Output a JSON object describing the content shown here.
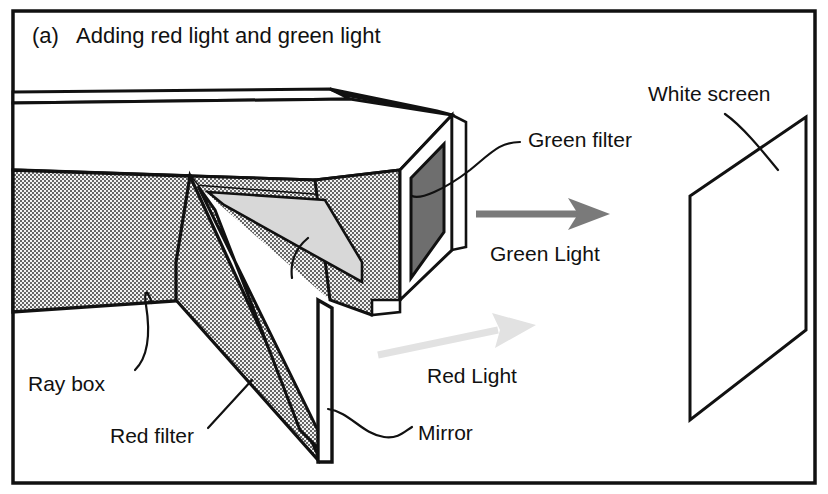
{
  "figure": {
    "panel_label": "(a)",
    "title": "Adding red light and green light",
    "background_color": "#ffffff",
    "ink_color": "#111111"
  },
  "labels": {
    "green_filter": "Green filter",
    "white_screen": "White screen",
    "green_light": "Green Light",
    "red_light": "Red Light",
    "ray_box": "Ray box",
    "red_filter": "Red filter",
    "mirror": "Mirror"
  },
  "colors": {
    "stipple_gray": "#c9c9c9",
    "red_filter_fill": "#d8d8d8",
    "green_filter_fill": "#6e6e6e",
    "green_arrow": "#7a7a7a",
    "red_arrow": "#e0e0e0",
    "box_lid_white": "#ffffff",
    "outline": "#111111"
  },
  "elements": {
    "ray_box": "stippled rectangular box seen in perspective, open at left",
    "mirror": "angled flat plate inside the ray box",
    "red_filter": "light gray triangular panel on the mirror face",
    "green_filter": "dark gray square panel on the far end of the ray box",
    "white_screen": "outlined parallelogram at right",
    "green_light_arrow": "horizontal gray arrow pointing right",
    "red_light_arrow": "pale gray arrow angled up to the right"
  }
}
